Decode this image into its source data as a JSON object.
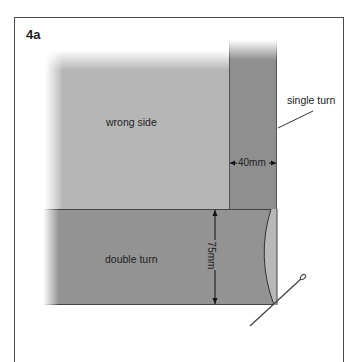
{
  "figure": {
    "label": "4a",
    "regions": {
      "wrong_side": "wrong side",
      "double_turn": "double turn"
    },
    "callouts": {
      "single_turn": "single turn"
    },
    "dimensions": {
      "single_turn_width": "40mm",
      "double_turn_height": "75mm"
    },
    "colors": {
      "frame": "#4a4a4a",
      "wrong_side_fill": "#b6b6b6",
      "strip_fill": "#8f8f8f",
      "band_fill": "#939393",
      "fold_fill": "#b8b8b8",
      "line": "#333333"
    }
  }
}
